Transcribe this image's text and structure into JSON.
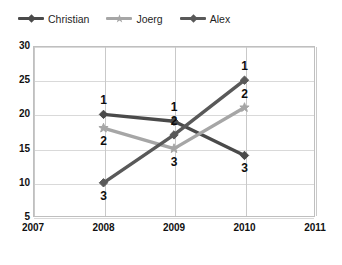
{
  "chart_data": {
    "type": "line",
    "title": "",
    "xlabel": "",
    "ylabel": "",
    "x": [
      2008,
      2009,
      2010
    ],
    "xticks": [
      "2007",
      "2008",
      "2009",
      "2010",
      "2011"
    ],
    "yticks": [
      "5",
      "10",
      "15",
      "20",
      "25",
      "30"
    ],
    "xlim": [
      2007,
      2011
    ],
    "ylim": [
      5,
      30
    ],
    "grid": true,
    "legend_position": "top-left",
    "series": [
      {
        "name": "Christian",
        "color": "#4a4a4a",
        "marker": "diamond",
        "values": [
          20,
          19,
          14
        ],
        "point_labels": [
          "1",
          "1",
          "3"
        ]
      },
      {
        "name": "Joerg",
        "color": "#a6a6a6",
        "marker": "star",
        "values": [
          18,
          15,
          21
        ],
        "point_labels": [
          "2",
          "3",
          "2"
        ]
      },
      {
        "name": "Alex",
        "color": "#595959",
        "marker": "diamond",
        "values": [
          10,
          17,
          25
        ],
        "point_labels": [
          "3",
          "2",
          "1"
        ]
      }
    ]
  },
  "legend": {
    "items": [
      {
        "label": "Christian"
      },
      {
        "label": "Joerg"
      },
      {
        "label": "Alex"
      }
    ]
  },
  "colors": {
    "background": "#ffffff",
    "grid": "#d9d9d9",
    "frame": "#bfbfbf",
    "text": "#111111"
  }
}
